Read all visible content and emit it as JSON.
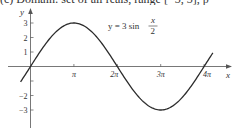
{
  "header": {
    "cropped_text": "(c) Domain: set of all reals, range [−3, 3], p"
  },
  "chart_data": {
    "type": "line",
    "title": "",
    "equation": {
      "lhs": "y = 3 sin",
      "num": "x",
      "den": "2"
    },
    "xlabel": "x",
    "ylabel": "y",
    "x_ticks": [
      {
        "value": 3.14159,
        "label": "π"
      },
      {
        "value": 6.28319,
        "label": "2π"
      },
      {
        "value": 9.42478,
        "label": "3π"
      },
      {
        "value": 12.56637,
        "label": "4π"
      }
    ],
    "y_ticks": [
      {
        "value": 3,
        "label": "3"
      },
      {
        "value": 2,
        "label": "2"
      },
      {
        "value": 1,
        "label": "1"
      },
      {
        "value": -1,
        "label": ""
      },
      {
        "value": -2,
        "label": "−2"
      },
      {
        "value": -3,
        "label": "−3"
      }
    ],
    "xlim": [
      -0.7,
      14.2
    ],
    "ylim": [
      -3.7,
      3.5
    ],
    "grid": false,
    "series": [
      {
        "name": "y = 3 sin(x/2)",
        "function": "3*sin(x/2)",
        "domain": [
          -0.72,
          13.2
        ],
        "x": [
          -0.72,
          0,
          1.5708,
          3.1416,
          4.7124,
          6.2832,
          7.854,
          9.4248,
          10.9956,
          12.5664,
          13.2
        ],
        "y": [
          -1.06,
          0,
          2.12,
          3,
          2.12,
          0,
          -2.12,
          -3,
          -2.12,
          0,
          0.95
        ],
        "color": "#2b2b2b"
      }
    ],
    "key_points": {
      "maximum": {
        "x": "π",
        "y": 3
      },
      "minimum": {
        "x": "3π",
        "y": -3
      },
      "zeros": [
        "0",
        "2π",
        "4π"
      ]
    }
  }
}
